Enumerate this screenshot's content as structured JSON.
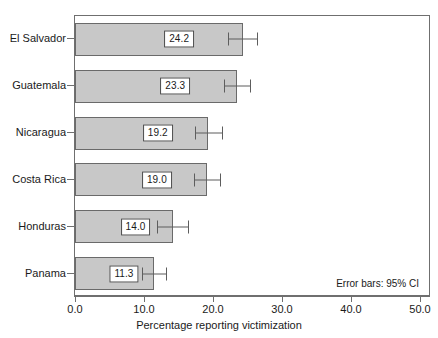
{
  "chart_data": {
    "type": "bar",
    "orientation": "horizontal",
    "title": "",
    "xlabel": "Percentage reporting victimization",
    "ylabel": "",
    "xlim": [
      0.0,
      50.0
    ],
    "xticks": [
      "0.0",
      "10.0",
      "20.0",
      "30.0",
      "40.0",
      "50.0"
    ],
    "xtick_values": [
      0,
      10,
      20,
      30,
      40,
      50
    ],
    "grid": false,
    "legend": null,
    "annotation": "Error bars: 95% CI",
    "categories": [
      "El Salvador",
      "Guatemala",
      "Nicaragua",
      "Costa Rica",
      "Honduras",
      "Panama"
    ],
    "values": [
      24.2,
      23.3,
      19.2,
      19.0,
      14.0,
      11.3
    ],
    "value_labels": [
      "24.2",
      "23.3",
      "19.2",
      "19.0",
      "14.0",
      "11.3"
    ],
    "error_low": [
      22.1,
      21.4,
      17.3,
      17.1,
      11.8,
      9.5
    ],
    "error_high": [
      26.3,
      25.2,
      21.1,
      20.9,
      16.2,
      13.1
    ],
    "bars": [
      {
        "category": "El Salvador",
        "value": 24.2,
        "label": "24.2",
        "ci_low": 22.1,
        "ci_high": 26.3
      },
      {
        "category": "Guatemala",
        "value": 23.3,
        "label": "23.3",
        "ci_low": 21.4,
        "ci_high": 25.2
      },
      {
        "category": "Nicaragua",
        "value": 19.2,
        "label": "19.2",
        "ci_low": 17.3,
        "ci_high": 21.1
      },
      {
        "category": "Costa Rica",
        "value": 19.0,
        "label": "19.0",
        "ci_low": 17.1,
        "ci_high": 20.9
      },
      {
        "category": "Honduras",
        "value": 14.0,
        "label": "14.0",
        "ci_low": 11.8,
        "ci_high": 16.2
      },
      {
        "category": "Panama",
        "value": 11.3,
        "label": "11.3",
        "ci_low": 9.5,
        "ci_high": 13.1
      }
    ],
    "colors": {
      "bar_fill": "#c8c8c8",
      "bar_border": "#6a6a6a",
      "error_bar": "#5d5d5d",
      "frame": "#6f6f6f",
      "plot_background": "#ffffff",
      "text": "#1a1a1a"
    }
  }
}
